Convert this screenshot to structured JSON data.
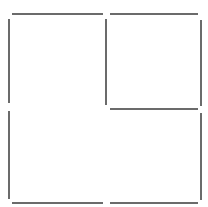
{
  "diagram": {
    "width": 208,
    "height": 207,
    "background": "#ffffff",
    "stroke_color": "#6b6b6b",
    "stroke_width": 2,
    "segments": [
      {
        "name": "top-edge-left",
        "x1": 12,
        "y1": 14,
        "x2": 103,
        "y2": 14
      },
      {
        "name": "top-edge-right",
        "x1": 110,
        "y1": 14,
        "x2": 198,
        "y2": 14
      },
      {
        "name": "left-edge-upper",
        "x1": 9,
        "y1": 19,
        "x2": 9,
        "y2": 103
      },
      {
        "name": "left-edge-lower",
        "x1": 9,
        "y1": 111,
        "x2": 9,
        "y2": 199
      },
      {
        "name": "middle-divider",
        "x1": 106,
        "y1": 19,
        "x2": 106,
        "y2": 105
      },
      {
        "name": "right-edge-upper",
        "x1": 201,
        "y1": 20,
        "x2": 201,
        "y2": 106
      },
      {
        "name": "right-edge-lower",
        "x1": 201,
        "y1": 113,
        "x2": 201,
        "y2": 200
      },
      {
        "name": "inner-horizontal",
        "x1": 110,
        "y1": 109,
        "x2": 198,
        "y2": 109
      },
      {
        "name": "bottom-edge-left",
        "x1": 12,
        "y1": 203,
        "x2": 103,
        "y2": 203
      },
      {
        "name": "bottom-edge-right",
        "x1": 110,
        "y1": 203,
        "x2": 198,
        "y2": 203
      }
    ]
  }
}
